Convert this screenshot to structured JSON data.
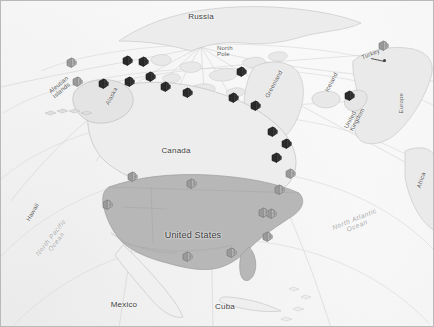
{
  "map": {
    "title": "North America and North Atlantic region map with facility markers",
    "background_color": "#8d8d8d",
    "globe_color": "#f4f4f4",
    "landmass_fill": "#b9b9b9",
    "marker_dark_color": "#2b2b2b",
    "marker_light_color": "#9a9a9a",
    "labels": [
      {
        "id": "russia",
        "text": "Russia",
        "x": 200,
        "y": 12,
        "class": "country",
        "rotate": 0,
        "align": "center"
      },
      {
        "id": "north-pole",
        "text": "North\nPole",
        "x": 216,
        "y": 44,
        "class": "small",
        "rotate": 0,
        "align": "left"
      },
      {
        "id": "aleutian-islands",
        "text": "Aleutian\nIslands",
        "x": 48,
        "y": 80,
        "class": "small",
        "rotate": -40,
        "align": "left"
      },
      {
        "id": "alaska",
        "text": "Alaska",
        "x": 101,
        "y": 92,
        "class": "small",
        "rotate": -62,
        "align": "left"
      },
      {
        "id": "greenland",
        "text": "Greenland",
        "x": 258,
        "y": 80,
        "class": "small",
        "rotate": -62,
        "align": "left"
      },
      {
        "id": "iceland",
        "text": "Iceland",
        "x": 320,
        "y": 78,
        "class": "small",
        "rotate": -62,
        "align": "left"
      },
      {
        "id": "turkey",
        "text": "Turkey",
        "x": 360,
        "y": 50,
        "class": "small",
        "rotate": -22,
        "align": "left"
      },
      {
        "id": "united-kingdom",
        "text": "United\nKingdom",
        "x": 341,
        "y": 111,
        "class": "small",
        "rotate": -62,
        "align": "left"
      },
      {
        "id": "europe",
        "text": "Europe",
        "x": 390,
        "y": 99,
        "class": "small",
        "rotate": -90,
        "align": "left"
      },
      {
        "id": "africa",
        "text": "Africa",
        "x": 412,
        "y": 176,
        "class": "small",
        "rotate": -72,
        "align": "left"
      },
      {
        "id": "canada",
        "text": "Canada",
        "x": 175,
        "y": 146,
        "class": "country",
        "rotate": 0,
        "align": "center"
      },
      {
        "id": "united-states",
        "text": "United States",
        "x": 192,
        "y": 230,
        "class": "big",
        "rotate": 0,
        "align": "center"
      },
      {
        "id": "hawaii",
        "text": "Hawaii",
        "x": 22,
        "y": 208,
        "class": "small",
        "rotate": -60,
        "align": "left"
      },
      {
        "id": "mexico",
        "text": "Mexico",
        "x": 123,
        "y": 300,
        "class": "country",
        "rotate": 0,
        "align": "center"
      },
      {
        "id": "cuba",
        "text": "Cuba",
        "x": 224,
        "y": 302,
        "class": "country",
        "rotate": 0,
        "align": "center"
      },
      {
        "id": "north-pacific-ocean",
        "text": "North Pacific\nOcean",
        "x": 53,
        "y": 232,
        "class": "ocean",
        "rotate": -52,
        "align": "center"
      },
      {
        "id": "north-atlantic-ocean",
        "text": "North Atlantic\nOcean",
        "x": 355,
        "y": 215,
        "class": "ocean",
        "rotate": -22,
        "align": "center"
      }
    ],
    "markers": [
      {
        "id": "m01",
        "x": 70,
        "y": 65,
        "tone": "light"
      },
      {
        "id": "m02",
        "x": 76,
        "y": 84,
        "tone": "light"
      },
      {
        "id": "m03",
        "x": 126,
        "y": 63,
        "tone": "dark"
      },
      {
        "id": "m04",
        "x": 142,
        "y": 64,
        "tone": "dark"
      },
      {
        "id": "m05",
        "x": 128,
        "y": 84,
        "tone": "dark"
      },
      {
        "id": "m06",
        "x": 149,
        "y": 79,
        "tone": "dark"
      },
      {
        "id": "m07",
        "x": 164,
        "y": 89,
        "tone": "dark"
      },
      {
        "id": "m08",
        "x": 186,
        "y": 95,
        "tone": "dark"
      },
      {
        "id": "m09",
        "x": 102,
        "y": 86,
        "tone": "dark"
      },
      {
        "id": "m10",
        "x": 240,
        "y": 74,
        "tone": "dark"
      },
      {
        "id": "m11",
        "x": 232,
        "y": 100,
        "tone": "dark"
      },
      {
        "id": "m12",
        "x": 254,
        "y": 108,
        "tone": "dark"
      },
      {
        "id": "m13",
        "x": 271,
        "y": 134,
        "tone": "dark"
      },
      {
        "id": "m14",
        "x": 285,
        "y": 146,
        "tone": "dark"
      },
      {
        "id": "m15",
        "x": 275,
        "y": 160,
        "tone": "dark"
      },
      {
        "id": "m16",
        "x": 289,
        "y": 176,
        "tone": "light"
      },
      {
        "id": "m17",
        "x": 278,
        "y": 192,
        "tone": "light"
      },
      {
        "id": "m18",
        "x": 270,
        "y": 216,
        "tone": "light"
      },
      {
        "id": "m19",
        "x": 266,
        "y": 239,
        "tone": "light"
      },
      {
        "id": "m20",
        "x": 348,
        "y": 98,
        "tone": "dark"
      },
      {
        "id": "m21",
        "x": 382,
        "y": 48,
        "tone": "light"
      },
      {
        "id": "m22",
        "x": 131,
        "y": 179,
        "tone": "light"
      },
      {
        "id": "m23",
        "x": 106,
        "y": 207,
        "tone": "light"
      },
      {
        "id": "m24",
        "x": 190,
        "y": 186,
        "tone": "light"
      },
      {
        "id": "m25",
        "x": 262,
        "y": 215,
        "tone": "light"
      },
      {
        "id": "m26",
        "x": 186,
        "y": 259,
        "tone": "light"
      },
      {
        "id": "m27",
        "x": 230,
        "y": 255,
        "tone": "light"
      }
    ],
    "turkey_leader": {
      "x1": 370,
      "y1": 57,
      "x2": 383,
      "y2": 60
    }
  }
}
